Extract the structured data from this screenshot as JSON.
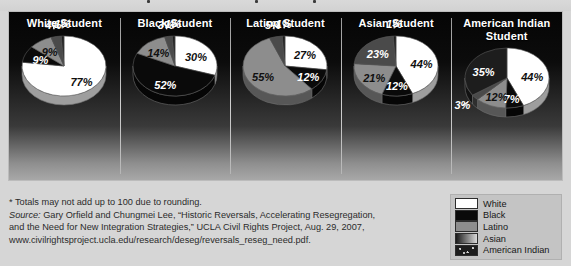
{
  "legend": {
    "items": [
      {
        "label": "White",
        "color": "#ffffff",
        "key": "white"
      },
      {
        "label": "Black",
        "color": "#0a0a0a",
        "key": "black"
      },
      {
        "label": "Latino",
        "color": "#8d8d8d",
        "key": "latino"
      },
      {
        "label": "Asian",
        "color": "#4a4a4a",
        "key": "asian"
      },
      {
        "label": "American Indian",
        "color": "#1d1d1d",
        "key": "american_indian"
      }
    ]
  },
  "notes": {
    "footnote": "* Totals may not add up to 100 due to rounding.",
    "source_word": "Source:",
    "source_line1": " Gary Orfield and Chungmei Lee, “Historic Reversals, Accelerating Resegregation,",
    "source_line2": "and the Need for New Integration Strategies,” UCLA Civil Rights Project, Aug. 29, 2007,",
    "source_line3": "www.civilrightsproject.ucla.edu/research/deseg/reversals_reseg_need.pdf."
  },
  "chart_data": [
    {
      "type": "pie",
      "title": "White Student",
      "categories": [
        "White",
        "Black",
        "Latino",
        "Asian",
        "American Indian"
      ],
      "values": [
        77,
        9,
        9,
        4,
        1
      ],
      "labels": [
        "77%",
        "9%",
        "9%",
        "4%",
        "1%"
      ],
      "colors": [
        "#ffffff",
        "#0a0a0a",
        "#8d8d8d",
        "#4a4a4a",
        "#1d1d1d"
      ]
    },
    {
      "type": "pie",
      "title": "Black Student",
      "categories": [
        "White",
        "Black",
        "Latino",
        "Asian",
        "American Indian"
      ],
      "values": [
        30,
        52,
        14,
        3,
        1
      ],
      "labels": [
        "30%",
        "52%",
        "14%",
        "3%",
        "1%"
      ],
      "colors": [
        "#ffffff",
        "#0a0a0a",
        "#8d8d8d",
        "#4a4a4a",
        "#1d1d1d"
      ]
    },
    {
      "type": "pie",
      "title": "Latino Student",
      "categories": [
        "White",
        "Black",
        "Latino",
        "Asian",
        "American Indian"
      ],
      "values": [
        27,
        12,
        55,
        5,
        1
      ],
      "labels": [
        "27%",
        "12%",
        "55%",
        "5%",
        "1%"
      ],
      "colors": [
        "#ffffff",
        "#0a0a0a",
        "#8d8d8d",
        "#4a4a4a",
        "#1d1d1d"
      ]
    },
    {
      "type": "pie",
      "title": "Asian Student",
      "categories": [
        "White",
        "Black",
        "Latino",
        "Asian",
        "American Indian"
      ],
      "values": [
        44,
        12,
        21,
        23,
        1
      ],
      "labels": [
        "44%",
        "12%",
        "21%",
        "23%",
        "1%"
      ],
      "colors": [
        "#ffffff",
        "#0a0a0a",
        "#8d8d8d",
        "#4a4a4a",
        "#1d1d1d"
      ]
    },
    {
      "type": "pie",
      "title": "American Indian Student",
      "categories": [
        "White",
        "Black",
        "Latino",
        "Asian",
        "American Indian"
      ],
      "values": [
        44,
        7,
        12,
        3,
        35
      ],
      "labels": [
        "44%",
        "7%",
        "12%",
        "3%",
        "35%"
      ],
      "colors": [
        "#ffffff",
        "#0a0a0a",
        "#8d8d8d",
        "#4a4a4a",
        "#1d1d1d"
      ]
    }
  ]
}
